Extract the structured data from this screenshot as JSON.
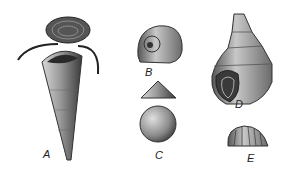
{
  "figure": {
    "panels": [
      {
        "id": "A",
        "label": "A",
        "subject": "cone-shaped shell with operculum and paired appendages"
      },
      {
        "id": "B",
        "label": "B",
        "subject": "coiled shell, apertural view"
      },
      {
        "id": "C",
        "label": "C",
        "subject": "low conical shell, side and top views"
      },
      {
        "id": "D",
        "label": "D",
        "subject": "high-spired gastropod shell with aperture"
      },
      {
        "id": "E",
        "label": "E",
        "subject": "ribbed cap-shaped shell"
      }
    ]
  },
  "colors": {
    "ink": "#222222",
    "mid": "#777777",
    "light": "#bbbbbb",
    "background": "#ffffff"
  }
}
